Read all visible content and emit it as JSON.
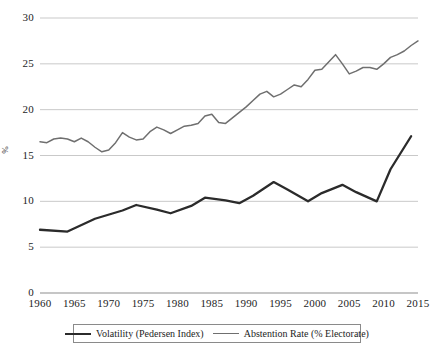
{
  "chart_data": {
    "type": "line",
    "title": "",
    "xlabel": "",
    "ylabel": "%",
    "xlim": [
      1960,
      2015
    ],
    "ylim": [
      0,
      30
    ],
    "ytick_labels": [
      "30",
      "25",
      "20",
      "15",
      "10",
      "5",
      "0"
    ],
    "yticks": [
      30,
      25,
      20,
      15,
      10,
      5,
      0
    ],
    "xtick_labels": [
      "1960",
      "1965",
      "1970",
      "1975",
      "1980",
      "1985",
      "1990",
      "1995",
      "2000",
      "2005",
      "2010",
      "2015"
    ],
    "xticks": [
      1960,
      1965,
      1970,
      1975,
      1980,
      1985,
      1990,
      1995,
      2000,
      2005,
      2010,
      2015
    ],
    "grid": true,
    "legend_position": "bottom",
    "series": [
      {
        "name": "Volatility (Pedersen Index)",
        "color": "#2b2b2b",
        "x": [
          1960,
          1964,
          1968,
          1972,
          1974,
          1977,
          1979,
          1982,
          1984,
          1987,
          1989,
          1991,
          1994,
          1996,
          1999,
          2001,
          2004,
          2006,
          2009,
          2011,
          2014
        ],
        "values": [
          6.9,
          6.7,
          8.1,
          9.0,
          9.6,
          9.1,
          8.7,
          9.5,
          10.4,
          10.1,
          9.8,
          10.6,
          12.1,
          11.3,
          10.0,
          10.9,
          11.8,
          11.0,
          10.0,
          13.5,
          17.1
        ]
      },
      {
        "name": "Abstention Rate (% Electorate)",
        "color": "#6f6f6f",
        "x": [
          1960,
          1961,
          1962,
          1963,
          1964,
          1965,
          1966,
          1967,
          1968,
          1969,
          1970,
          1971,
          1972,
          1973,
          1974,
          1975,
          1976,
          1977,
          1978,
          1979,
          1980,
          1981,
          1982,
          1983,
          1984,
          1985,
          1986,
          1987,
          1988,
          1989,
          1990,
          1991,
          1992,
          1993,
          1994,
          1995,
          1996,
          1997,
          1998,
          1999,
          2000,
          2001,
          2002,
          2003,
          2004,
          2005,
          2006,
          2007,
          2008,
          2009,
          2010,
          2011,
          2012,
          2013,
          2014,
          2015
        ],
        "values": [
          16.5,
          16.4,
          16.8,
          16.9,
          16.8,
          16.5,
          16.9,
          16.5,
          15.9,
          15.4,
          15.6,
          16.4,
          17.5,
          17.0,
          16.7,
          16.8,
          17.6,
          18.1,
          17.8,
          17.4,
          17.8,
          18.2,
          18.3,
          18.5,
          19.3,
          19.5,
          18.6,
          18.5,
          19.1,
          19.7,
          20.3,
          21.0,
          21.7,
          22.0,
          21.4,
          21.7,
          22.2,
          22.7,
          22.5,
          23.3,
          24.3,
          24.4,
          25.2,
          26.0,
          25.0,
          23.9,
          24.2,
          24.6,
          24.6,
          24.4,
          25.0,
          25.7,
          26.0,
          26.4,
          27.0,
          27.5
        ]
      }
    ]
  },
  "legend": {
    "entries": [
      {
        "label": "Volatility (Pedersen Index)"
      },
      {
        "label": "Abstention Rate (% Electorate)"
      }
    ]
  }
}
